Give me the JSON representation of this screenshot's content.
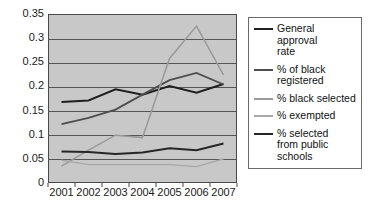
{
  "chart_data": {
    "type": "line",
    "title": "",
    "subtitle": "",
    "xlabel": "",
    "ylabel": "",
    "categories": [
      "2001",
      "2002",
      "2003",
      "2004",
      "2005",
      "2006",
      "2007"
    ],
    "x": [
      2001,
      2002,
      2003,
      2004,
      2005,
      2006,
      2007
    ],
    "ylim": [
      0,
      0.35
    ],
    "yticks": [
      "0",
      "0.05",
      "0.1",
      "0.15",
      "0.2",
      "0.25",
      "0.3",
      "0.35"
    ],
    "ytick_values": [
      0,
      0.05,
      0.1,
      0.15,
      0.2,
      0.25,
      0.3,
      0.35
    ],
    "grid": "horizontal",
    "legend_position": "right",
    "plot_background": "#c8c8c8",
    "series": [
      {
        "name": "General approval rate",
        "legend_label": "General approval\nrate",
        "color": "#1f1f1f",
        "width": 2.0,
        "values": [
          0.168,
          0.171,
          0.194,
          0.183,
          0.201,
          0.187,
          0.205
        ]
      },
      {
        "name": "% of black registered",
        "legend_label": "% of black\nregistered",
        "color": "#4d4d4d",
        "width": 1.8,
        "values": [
          0.122,
          0.135,
          0.152,
          0.183,
          0.213,
          0.228,
          0.204
        ]
      },
      {
        "name": "% black selected",
        "legend_label": "% black selected",
        "color": "#9a9a9a",
        "width": 1.5,
        "values": [
          0.035,
          0.068,
          0.099,
          0.094,
          0.258,
          0.325,
          0.224
        ]
      },
      {
        "name": "% exempted",
        "legend_label": "% exempted",
        "color": "#a8a8a8",
        "width": 1.4,
        "values": [
          0.047,
          0.038,
          0.038,
          0.038,
          0.038,
          0.034,
          0.05
        ]
      },
      {
        "name": "% selected from public schools",
        "legend_label": "% selected\nfrom public\nschools",
        "color": "#262626",
        "width": 2.0,
        "values": [
          0.065,
          0.064,
          0.06,
          0.063,
          0.072,
          0.068,
          0.082
        ]
      }
    ]
  },
  "legend": {
    "items": [
      {
        "label": "General approval\nrate"
      },
      {
        "label": "% of black\nregistered"
      },
      {
        "label": "% black selected"
      },
      {
        "label": "% exempted"
      },
      {
        "label": "% selected\nfrom public\nschools"
      }
    ]
  }
}
